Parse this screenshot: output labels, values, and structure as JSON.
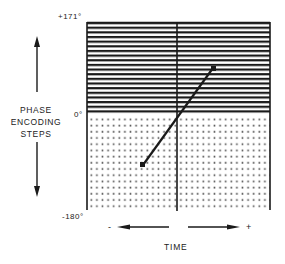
{
  "diagram": {
    "y_axis": {
      "title_lines": [
        "PHASE",
        "ENCODING",
        "STEPS"
      ],
      "tick_top": "+171°",
      "tick_mid": "0°",
      "tick_bottom": "-180°"
    },
    "x_axis": {
      "title": "TIME",
      "minus_sign": "-",
      "plus_sign": "+"
    },
    "regions": {
      "upper": "horizontal-stripes",
      "lower": "dot-grid"
    },
    "trajectory": {
      "start": {
        "x": 143,
        "y": 165
      },
      "end": {
        "x": 213,
        "y": 68
      },
      "crosses_center_at_zero": true
    },
    "colors": {
      "ink": "#1a1a1a",
      "background": "#ffffff",
      "dots": "#555555"
    }
  }
}
